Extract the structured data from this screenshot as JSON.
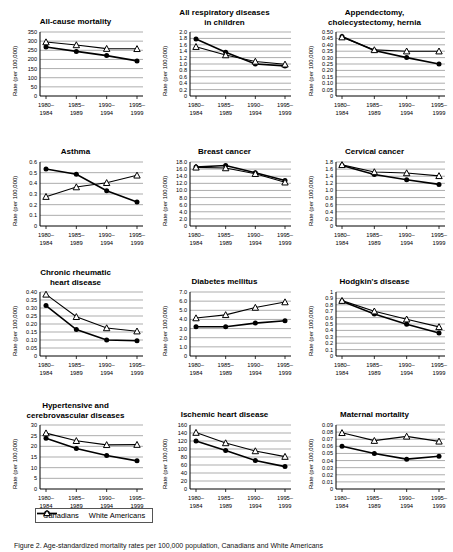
{
  "figure": {
    "caption": "Figure 2. Age-standardized mortality rates per 100,000 population, Canadians and White Americans",
    "legend": [
      {
        "label": "Canadians",
        "marker": "filled-circle",
        "color": "#000000"
      },
      {
        "label": "White Americans",
        "marker": "open-triangle",
        "color": "#000000"
      }
    ],
    "ylabel": "Rate (per 100,000)",
    "xcategories": [
      [
        "1980–",
        "1984"
      ],
      [
        "1985–",
        "1989"
      ],
      [
        "1990–",
        "1994"
      ],
      [
        "1995–",
        "1999"
      ]
    ]
  },
  "chart_data": [
    {
      "type": "line",
      "title": "All-cause mortality",
      "xlabel": "",
      "ylabel": "Rate (per 100,000)",
      "categories": [
        "1980–1984",
        "1985–1989",
        "1990–1994",
        "1995–1999"
      ],
      "ylim": [
        0,
        350
      ],
      "yticks": [
        0,
        50,
        100,
        150,
        200,
        250,
        300,
        350
      ],
      "yticklabels": [
        "0",
        "50",
        "100",
        "150",
        "200",
        "250",
        "300",
        "350"
      ],
      "grid": true,
      "legend_position": "bottom-figure",
      "series": [
        {
          "name": "Canadians",
          "values": [
            268,
            244,
            221,
            192
          ]
        },
        {
          "name": "White Americans",
          "values": [
            295,
            279,
            259,
            258
          ]
        }
      ]
    },
    {
      "type": "line",
      "title": "All respiratory diseases in children",
      "xlabel": "",
      "ylabel": "Rate (per 100,000)",
      "categories": [
        "1980–1984",
        "1985–1989",
        "1990–1994",
        "1995–1999"
      ],
      "ylim": [
        0,
        2.0
      ],
      "yticks": [
        0,
        0.2,
        0.4,
        0.6,
        0.8,
        1.0,
        1.2,
        1.4,
        1.6,
        1.8,
        2.0
      ],
      "yticklabels": [
        "0",
        "0.2",
        "0.4",
        "0.6",
        "0.8",
        "1.0",
        "1.2",
        "1.4",
        "1.6",
        "1.8",
        "2.0"
      ],
      "grid": true,
      "series": [
        {
          "name": "Canadians",
          "values": [
            1.78,
            1.37,
            1.0,
            0.94
          ]
        },
        {
          "name": "White Americans",
          "values": [
            1.54,
            1.28,
            1.08,
            0.99
          ]
        }
      ]
    },
    {
      "type": "line",
      "title": "Appendectomy, cholecystectomy, hernia",
      "xlabel": "",
      "ylabel": "Rate (per 100,000)",
      "categories": [
        "1980–1984",
        "1985–1989",
        "1990–1994",
        "1995–1999"
      ],
      "ylim": [
        0,
        0.5
      ],
      "yticks": [
        0,
        0.05,
        0.1,
        0.15,
        0.2,
        0.25,
        0.3,
        0.35,
        0.4,
        0.45,
        0.5
      ],
      "yticklabels": [
        "0",
        "0.05",
        "0.10",
        "0.15",
        "0.20",
        "0.25",
        "0.30",
        "0.35",
        "0.40",
        "0.45",
        "0.50"
      ],
      "grid": true,
      "series": [
        {
          "name": "Canadians",
          "values": [
            0.465,
            0.355,
            0.3,
            0.25
          ]
        },
        {
          "name": "White Americans",
          "values": [
            0.46,
            0.36,
            0.35,
            0.35
          ]
        }
      ]
    },
    {
      "type": "line",
      "title": "Asthma",
      "xlabel": "",
      "ylabel": "Rate (per 100,000)",
      "categories": [
        "1980–1984",
        "1985–1989",
        "1990–1994",
        "1995–1999"
      ],
      "ylim": [
        0,
        0.6
      ],
      "yticks": [
        0,
        0.1,
        0.2,
        0.3,
        0.4,
        0.5,
        0.6
      ],
      "yticklabels": [
        "0",
        "0.1",
        "0.2",
        "0.3",
        "0.4",
        "0.5",
        "0.6"
      ],
      "grid": true,
      "series": [
        {
          "name": "Canadians",
          "values": [
            0.535,
            0.485,
            0.33,
            0.225
          ]
        },
        {
          "name": "White Americans",
          "values": [
            0.275,
            0.365,
            0.405,
            0.475
          ]
        }
      ]
    },
    {
      "type": "line",
      "title": "Breast cancer",
      "xlabel": "",
      "ylabel": "Rate (per 100,000)",
      "categories": [
        "1980–1984",
        "1985–1989",
        "1990–1994",
        "1995–1999"
      ],
      "ylim": [
        0,
        18.0
      ],
      "yticks": [
        0,
        2.0,
        4.0,
        6.0,
        8.0,
        10.0,
        12.0,
        14.0,
        16.0,
        18.0
      ],
      "yticklabels": [
        "0",
        "2.0",
        "4.0",
        "6.0",
        "8.0",
        "10.0",
        "12.0",
        "14.0",
        "16.0",
        "18.0"
      ],
      "grid": true,
      "series": [
        {
          "name": "Canadians",
          "values": [
            16.6,
            17.0,
            15.0,
            12.8
          ]
        },
        {
          "name": "White Americans",
          "values": [
            16.5,
            16.3,
            14.7,
            12.3
          ]
        }
      ]
    },
    {
      "type": "line",
      "title": "Cervical cancer",
      "xlabel": "",
      "ylabel": "Rate (per 100,000)",
      "categories": [
        "1980–1984",
        "1985–1989",
        "1990–1994",
        "1995–1999"
      ],
      "ylim": [
        0,
        1.8
      ],
      "yticks": [
        0,
        0.2,
        0.4,
        0.6,
        0.8,
        1.0,
        1.2,
        1.4,
        1.6,
        1.8
      ],
      "yticklabels": [
        "0",
        "0.2",
        "0.4",
        "0.6",
        "0.8",
        "1.0",
        "1.2",
        "1.4",
        "1.6",
        "1.8"
      ],
      "grid": true,
      "series": [
        {
          "name": "Canadians",
          "values": [
            1.7,
            1.45,
            1.3,
            1.17
          ]
        },
        {
          "name": "White Americans",
          "values": [
            1.72,
            1.52,
            1.49,
            1.41
          ]
        }
      ]
    },
    {
      "type": "line",
      "title": "Chronic rheumatic heart disease",
      "xlabel": "",
      "ylabel": "Rate (per 100,000)",
      "categories": [
        "1980–1984",
        "1985–1989",
        "1990–1994",
        "1995–1999"
      ],
      "ylim": [
        0,
        0.4
      ],
      "yticks": [
        0,
        0.05,
        0.1,
        0.15,
        0.2,
        0.25,
        0.3,
        0.35,
        0.4
      ],
      "yticklabels": [
        "0",
        "0.05",
        "0.10",
        "0.15",
        "0.20",
        "0.25",
        "0.30",
        "0.35",
        "0.40"
      ],
      "grid": true,
      "series": [
        {
          "name": "Canadians",
          "values": [
            0.315,
            0.165,
            0.1,
            0.095
          ]
        },
        {
          "name": "White Americans",
          "values": [
            0.385,
            0.245,
            0.175,
            0.155
          ]
        }
      ]
    },
    {
      "type": "line",
      "title": "Diabetes mellitus",
      "xlabel": "",
      "ylabel": "Rate (per 100,000)",
      "categories": [
        "1980–1984",
        "1985–1989",
        "1990–1994",
        "1995–1999"
      ],
      "ylim": [
        0,
        7.0
      ],
      "yticks": [
        0,
        1.0,
        2.0,
        3.0,
        4.0,
        5.0,
        6.0,
        7.0
      ],
      "yticklabels": [
        "0",
        "1.0",
        "2.0",
        "3.0",
        "4.0",
        "5.0",
        "6.0",
        "7.0"
      ],
      "grid": true,
      "series": [
        {
          "name": "Canadians",
          "values": [
            3.2,
            3.2,
            3.6,
            3.85
          ]
        },
        {
          "name": "White Americans",
          "values": [
            4.15,
            4.5,
            5.3,
            5.9
          ]
        }
      ]
    },
    {
      "type": "line",
      "title": "Hodgkin's disease",
      "xlabel": "",
      "ylabel": "Rate (per 100,000)",
      "categories": [
        "1980–1984",
        "1985–1989",
        "1990–1994",
        "1995–1999"
      ],
      "ylim": [
        0,
        1.0
      ],
      "yticks": [
        0,
        0.1,
        0.2,
        0.3,
        0.4,
        0.5,
        0.6,
        0.7,
        0.8,
        0.9,
        1.0
      ],
      "yticklabels": [
        "0",
        "0.1",
        "0.2",
        "0.3",
        "0.4",
        "0.5",
        "0.6",
        "0.7",
        "0.8",
        "0.9",
        "1"
      ],
      "grid": true,
      "series": [
        {
          "name": "Canadians",
          "values": [
            0.855,
            0.655,
            0.495,
            0.36
          ]
        },
        {
          "name": "White Americans",
          "values": [
            0.865,
            0.7,
            0.575,
            0.455
          ]
        }
      ]
    },
    {
      "type": "line",
      "title": "Hypertensive and cerebrovascular diseases",
      "xlabel": "",
      "ylabel": "Rate (per 100,000)",
      "categories": [
        "1980–1984",
        "1985–1989",
        "1990–1994",
        "1995–1999"
      ],
      "ylim": [
        0,
        30
      ],
      "yticks": [
        0,
        5,
        10,
        15,
        20,
        25,
        30
      ],
      "yticklabels": [
        "0",
        "5",
        "10",
        "15",
        "20",
        "25",
        "30"
      ],
      "grid": true,
      "series": [
        {
          "name": "Canadians",
          "values": [
            23.8,
            19.0,
            15.7,
            13.2
          ]
        },
        {
          "name": "White Americans",
          "values": [
            26.2,
            22.6,
            20.7,
            20.8
          ]
        }
      ]
    },
    {
      "type": "line",
      "title": "Ischemic heart disease",
      "xlabel": "",
      "ylabel": "Rate (per 100,000)",
      "categories": [
        "1980–1984",
        "1985–1989",
        "1990–1994",
        "1995–1999"
      ],
      "ylim": [
        0,
        160
      ],
      "yticks": [
        0,
        20,
        40,
        60,
        80,
        100,
        120,
        140,
        160
      ],
      "yticklabels": [
        "0",
        "20",
        "40",
        "60",
        "80",
        "100",
        "120",
        "140",
        "160"
      ],
      "grid": true,
      "series": [
        {
          "name": "Canadians",
          "values": [
            120,
            96,
            71,
            56
          ]
        },
        {
          "name": "White Americans",
          "values": [
            141,
            115,
            95,
            81
          ]
        }
      ]
    },
    {
      "type": "line",
      "title": "Maternal mortality",
      "xlabel": "",
      "ylabel": "Rate (per 100,000)",
      "categories": [
        "1980–1984",
        "1985–1989",
        "1990–1994",
        "1995–1999"
      ],
      "ylim": [
        0,
        0.09
      ],
      "yticks": [
        0,
        0.01,
        0.02,
        0.03,
        0.04,
        0.05,
        0.06,
        0.07,
        0.08,
        0.09
      ],
      "yticklabels": [
        "0",
        "0.01",
        "0.02",
        "0.03",
        "0.04",
        "0.05",
        "0.06",
        "0.07",
        "0.08",
        "0.09"
      ],
      "grid": true,
      "series": [
        {
          "name": "Canadians",
          "values": [
            0.06,
            0.05,
            0.042,
            0.046
          ]
        },
        {
          "name": "White Americans",
          "values": [
            0.079,
            0.068,
            0.074,
            0.067
          ]
        }
      ]
    }
  ]
}
